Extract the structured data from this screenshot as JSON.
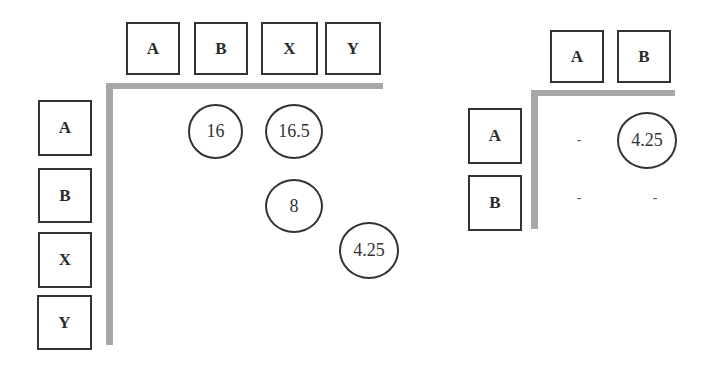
{
  "left_matrix": {
    "column_headers": [
      "A",
      "B",
      "X",
      "Y"
    ],
    "row_headers": [
      "A",
      "B",
      "X",
      "Y"
    ],
    "cells": [
      {
        "row": "A",
        "col": "B",
        "value": "16"
      },
      {
        "row": "A",
        "col": "X",
        "value": "16.5"
      },
      {
        "row": "B",
        "col": "X",
        "value": "8"
      },
      {
        "row": "X",
        "col": "Y",
        "value": "4.25"
      }
    ]
  },
  "right_matrix": {
    "column_headers": [
      "A",
      "B"
    ],
    "row_headers": [
      "A",
      "B"
    ],
    "cells": [
      {
        "row": "A",
        "col": "A",
        "value": "-"
      },
      {
        "row": "A",
        "col": "B",
        "value": "4.25"
      },
      {
        "row": "B",
        "col": "A",
        "value": "-"
      },
      {
        "row": "B",
        "col": "B",
        "value": "-"
      }
    ]
  },
  "colors": {
    "axis_bar": "#a8a8a8",
    "border": "#333333"
  }
}
